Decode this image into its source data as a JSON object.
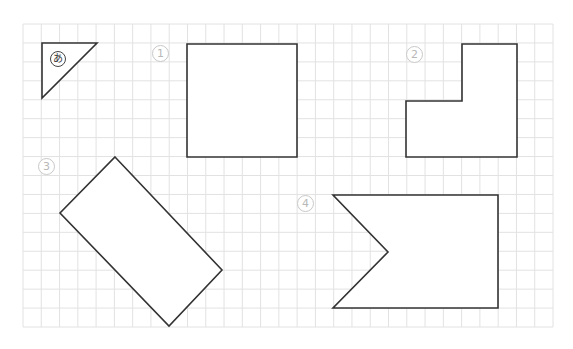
{
  "figure": {
    "grid": {
      "x0": 23,
      "y0": 24,
      "x1": 553,
      "y1": 327,
      "cols": 29,
      "rows": 16,
      "color": "#e2e2e2"
    },
    "shape_stroke": "#333333",
    "shapes": [
      {
        "id": "a",
        "label": "あ",
        "points": [
          [
            42,
            43
          ],
          [
            97,
            43
          ],
          [
            42,
            98
          ]
        ]
      },
      {
        "id": "1",
        "label": "①",
        "points": [
          [
            187,
            44
          ],
          [
            297,
            44
          ],
          [
            297,
            157
          ],
          [
            187,
            157
          ]
        ]
      },
      {
        "id": "2",
        "label": "②",
        "points": [
          [
            406,
            101
          ],
          [
            462,
            101
          ],
          [
            462,
            44
          ],
          [
            517,
            44
          ],
          [
            517,
            157
          ],
          [
            406,
            157
          ]
        ]
      },
      {
        "id": "3",
        "label": "③",
        "points": [
          [
            115,
            157
          ],
          [
            222,
            270
          ],
          [
            169,
            326
          ],
          [
            60,
            213
          ]
        ]
      },
      {
        "id": "4",
        "label": "④",
        "points": [
          [
            333,
            195
          ],
          [
            498,
            195
          ],
          [
            498,
            308
          ],
          [
            333,
            308
          ],
          [
            388,
            252
          ]
        ]
      }
    ],
    "labels": {
      "a": "あ",
      "one": "1",
      "two": "2",
      "three": "3",
      "four": "4"
    }
  }
}
